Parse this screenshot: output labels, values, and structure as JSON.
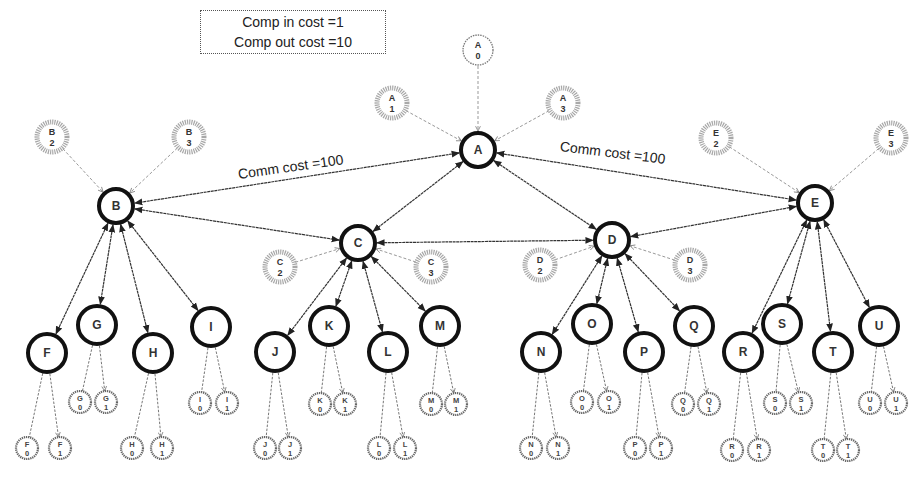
{
  "legend": {
    "comp_in": "Comp in cost =1",
    "comp_out": "Comp out cost =10"
  },
  "edge_labels": {
    "left": "Comm cost =100",
    "right": "Comm cost =100"
  },
  "colors": {
    "main_node_stroke": "#111111",
    "replica_stroke": "#9a9a9a",
    "leaf_stroke": "#666666",
    "edge": "#333333",
    "dashed_edge": "#999999"
  },
  "main_nodes": [
    {
      "id": "A",
      "x": 478,
      "y": 150,
      "r": 17
    },
    {
      "id": "B",
      "x": 116,
      "y": 206,
      "r": 17
    },
    {
      "id": "C",
      "x": 358,
      "y": 243,
      "r": 17
    },
    {
      "id": "D",
      "x": 612,
      "y": 240,
      "r": 17
    },
    {
      "id": "E",
      "x": 815,
      "y": 203,
      "r": 17
    },
    {
      "id": "F",
      "x": 47,
      "y": 353,
      "r": 19
    },
    {
      "id": "G",
      "x": 97,
      "y": 325,
      "r": 19
    },
    {
      "id": "H",
      "x": 153,
      "y": 353,
      "r": 19
    },
    {
      "id": "I",
      "x": 211,
      "y": 327,
      "r": 19
    },
    {
      "id": "J",
      "x": 275,
      "y": 352,
      "r": 19
    },
    {
      "id": "K",
      "x": 329,
      "y": 326,
      "r": 19
    },
    {
      "id": "L",
      "x": 388,
      "y": 352,
      "r": 19
    },
    {
      "id": "M",
      "x": 440,
      "y": 326,
      "r": 19
    },
    {
      "id": "N",
      "x": 541,
      "y": 352,
      "r": 19
    },
    {
      "id": "O",
      "x": 592,
      "y": 324,
      "r": 19
    },
    {
      "id": "P",
      "x": 644,
      "y": 352,
      "r": 19
    },
    {
      "id": "Q",
      "x": 694,
      "y": 326,
      "r": 19
    },
    {
      "id": "R",
      "x": 743,
      "y": 352,
      "r": 19
    },
    {
      "id": "S",
      "x": 782,
      "y": 324,
      "r": 19
    },
    {
      "id": "T",
      "x": 833,
      "y": 352,
      "r": 19
    },
    {
      "id": "U",
      "x": 879,
      "y": 326,
      "r": 19
    }
  ],
  "replica_nodes": [
    {
      "id": "A0",
      "label": "A",
      "sub": "0",
      "x": 478,
      "y": 50,
      "parent": "A",
      "style": "plain"
    },
    {
      "id": "A1",
      "label": "A",
      "sub": "1",
      "x": 392,
      "y": 103,
      "parent": "A",
      "style": "hatched"
    },
    {
      "id": "A3",
      "label": "A",
      "sub": "3",
      "x": 563,
      "y": 103,
      "parent": "A",
      "style": "hatched"
    },
    {
      "id": "B2",
      "label": "B",
      "sub": "2",
      "x": 52,
      "y": 137,
      "parent": "B",
      "style": "hatched"
    },
    {
      "id": "B3",
      "label": "B",
      "sub": "3",
      "x": 189,
      "y": 137,
      "parent": "B",
      "style": "hatched"
    },
    {
      "id": "C2",
      "label": "C",
      "sub": "2",
      "x": 280,
      "y": 267,
      "parent": "C",
      "style": "hatched"
    },
    {
      "id": "C3",
      "label": "C",
      "sub": "3",
      "x": 431,
      "y": 267,
      "parent": "C",
      "style": "hatched"
    },
    {
      "id": "D2",
      "label": "D",
      "sub": "2",
      "x": 540,
      "y": 265,
      "parent": "D",
      "style": "hatched"
    },
    {
      "id": "D3",
      "label": "D",
      "sub": "3",
      "x": 690,
      "y": 265,
      "parent": "D",
      "style": "hatched"
    },
    {
      "id": "E2",
      "label": "E",
      "sub": "2",
      "x": 716,
      "y": 138,
      "parent": "E",
      "style": "hatched"
    },
    {
      "id": "E3",
      "label": "E",
      "sub": "3",
      "x": 891,
      "y": 138,
      "parent": "E",
      "style": "hatched"
    }
  ],
  "leaf_nodes": [
    {
      "label": "F",
      "sub": "0",
      "x": 27,
      "y": 448,
      "parent": "F"
    },
    {
      "label": "F",
      "sub": "1",
      "x": 60,
      "y": 448,
      "parent": "F"
    },
    {
      "label": "G",
      "sub": "0",
      "x": 80,
      "y": 402,
      "parent": "G"
    },
    {
      "label": "G",
      "sub": "1",
      "x": 106,
      "y": 402,
      "parent": "G"
    },
    {
      "label": "H",
      "sub": "0",
      "x": 132,
      "y": 448,
      "parent": "H"
    },
    {
      "label": "H",
      "sub": "1",
      "x": 162,
      "y": 448,
      "parent": "H"
    },
    {
      "label": "I",
      "sub": "0",
      "x": 200,
      "y": 403,
      "parent": "I"
    },
    {
      "label": "I",
      "sub": "1",
      "x": 227,
      "y": 403,
      "parent": "I"
    },
    {
      "label": "J",
      "sub": "0",
      "x": 265,
      "y": 448,
      "parent": "J"
    },
    {
      "label": "J",
      "sub": "1",
      "x": 290,
      "y": 448,
      "parent": "J"
    },
    {
      "label": "K",
      "sub": "0",
      "x": 320,
      "y": 404,
      "parent": "K"
    },
    {
      "label": "K",
      "sub": "1",
      "x": 345,
      "y": 404,
      "parent": "K"
    },
    {
      "label": "L",
      "sub": "0",
      "x": 379,
      "y": 448,
      "parent": "L"
    },
    {
      "label": "L",
      "sub": "1",
      "x": 405,
      "y": 448,
      "parent": "L"
    },
    {
      "label": "M",
      "sub": "0",
      "x": 431,
      "y": 404,
      "parent": "M"
    },
    {
      "label": "M",
      "sub": "1",
      "x": 456,
      "y": 404,
      "parent": "M"
    },
    {
      "label": "N",
      "sub": "0",
      "x": 531,
      "y": 448,
      "parent": "N"
    },
    {
      "label": "N",
      "sub": "1",
      "x": 558,
      "y": 448,
      "parent": "N"
    },
    {
      "label": "O",
      "sub": "0",
      "x": 582,
      "y": 402,
      "parent": "O"
    },
    {
      "label": "O",
      "sub": "1",
      "x": 609,
      "y": 402,
      "parent": "O"
    },
    {
      "label": "P",
      "sub": "0",
      "x": 635,
      "y": 448,
      "parent": "P"
    },
    {
      "label": "P",
      "sub": "1",
      "x": 661,
      "y": 448,
      "parent": "P"
    },
    {
      "label": "Q",
      "sub": "0",
      "x": 683,
      "y": 404,
      "parent": "Q"
    },
    {
      "label": "Q",
      "sub": "1",
      "x": 709,
      "y": 404,
      "parent": "Q"
    },
    {
      "label": "R",
      "sub": "0",
      "x": 732,
      "y": 450,
      "parent": "R"
    },
    {
      "label": "R",
      "sub": "1",
      "x": 759,
      "y": 450,
      "parent": "R"
    },
    {
      "label": "S",
      "sub": "0",
      "x": 775,
      "y": 403,
      "parent": "S"
    },
    {
      "label": "S",
      "sub": "1",
      "x": 801,
      "y": 403,
      "parent": "S"
    },
    {
      "label": "T",
      "sub": "0",
      "x": 823,
      "y": 450,
      "parent": "T"
    },
    {
      "label": "T",
      "sub": "1",
      "x": 848,
      "y": 450,
      "parent": "T"
    },
    {
      "label": "U",
      "sub": "0",
      "x": 870,
      "y": 403,
      "parent": "U"
    },
    {
      "label": "U",
      "sub": "1",
      "x": 896,
      "y": 403,
      "parent": "U"
    }
  ],
  "edges_bidirectional": [
    [
      "A",
      "B"
    ],
    [
      "A",
      "C"
    ],
    [
      "A",
      "D"
    ],
    [
      "A",
      "E"
    ],
    [
      "B",
      "C"
    ],
    [
      "C",
      "D"
    ],
    [
      "D",
      "E"
    ],
    [
      "B",
      "F"
    ],
    [
      "B",
      "G"
    ],
    [
      "B",
      "H"
    ],
    [
      "B",
      "I"
    ],
    [
      "C",
      "J"
    ],
    [
      "C",
      "K"
    ],
    [
      "C",
      "L"
    ],
    [
      "C",
      "M"
    ],
    [
      "D",
      "N"
    ],
    [
      "D",
      "O"
    ],
    [
      "D",
      "P"
    ],
    [
      "D",
      "Q"
    ],
    [
      "E",
      "R"
    ],
    [
      "E",
      "S"
    ],
    [
      "E",
      "T"
    ],
    [
      "E",
      "U"
    ]
  ]
}
